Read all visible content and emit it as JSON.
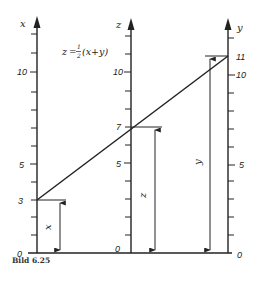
{
  "diagram": {
    "formula": "z = ½(x + y)",
    "caption": "Bild 6.25",
    "axes": [
      {
        "name": "x",
        "label": "x",
        "ticks": [
          0,
          1,
          2,
          3,
          4,
          5,
          6,
          7,
          8,
          9,
          10,
          11,
          12
        ],
        "labeled_ticks": [
          "0",
          "3",
          "5",
          "10"
        ],
        "marked_value": 3,
        "arrow_label": "x"
      },
      {
        "name": "z",
        "label": "z",
        "ticks": [
          0,
          1,
          2,
          3,
          4,
          5,
          6,
          7,
          8,
          9,
          10,
          11,
          12
        ],
        "labeled_ticks": [
          "0",
          "5",
          "7",
          "10"
        ],
        "marked_value": 7,
        "arrow_label": "z"
      },
      {
        "name": "y",
        "label": "y",
        "ticks": [
          0,
          1,
          2,
          3,
          4,
          5,
          6,
          7,
          8,
          9,
          10,
          11,
          12
        ],
        "labeled_ticks": [
          "0",
          "5",
          "10",
          "11"
        ],
        "marked_value": 11,
        "arrow_label": "y"
      }
    ],
    "connecting_line": {
      "from": {
        "axis": "x",
        "value": 3
      },
      "through": {
        "axis": "z",
        "value": 7
      },
      "to": {
        "axis": "y",
        "value": 11
      }
    },
    "colors": {
      "ink": "#222222",
      "background": "#ffffff"
    }
  },
  "labels": {
    "x_axis": "x",
    "z_axis": "z",
    "y_axis": "y",
    "x0": "0",
    "x3": "3",
    "x5": "5",
    "x10": "10",
    "z0": "0",
    "z5": "5",
    "z7": "7",
    "z10": "10",
    "y0": "0",
    "y5": "5",
    "y10": "10",
    "y11": "11",
    "x_dim": "x",
    "z_dim": "z",
    "y_dim": "y",
    "formula_z": "z",
    "formula_eq": "=",
    "formula_num": "1",
    "formula_den": "2",
    "formula_rest": "(x+y)",
    "caption": "Bild 6.25"
  }
}
